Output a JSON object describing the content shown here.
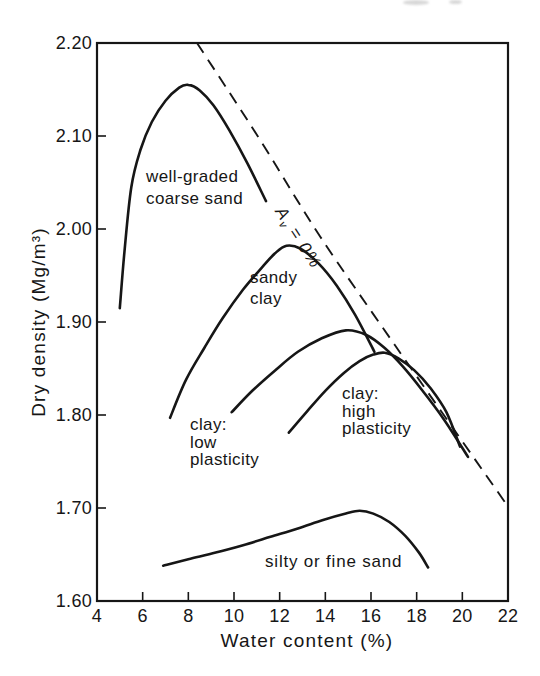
{
  "figure": {
    "y_axis": {
      "title": "Dry density (Mg/m³)",
      "tick_labels": [
        "2.20",
        "2.10",
        "2.00",
        "1.90",
        "1.80",
        "1.70",
        "1.60"
      ],
      "tick_values": [
        2.2,
        2.1,
        2.0,
        1.9,
        1.8,
        1.7,
        1.6
      ]
    },
    "x_axis": {
      "title": "Water content (%)",
      "tick_labels": [
        "4",
        "6",
        "8",
        "10",
        "12",
        "14",
        "16",
        "18",
        "20",
        "22"
      ],
      "tick_values": [
        4,
        6,
        8,
        10,
        12,
        14,
        16,
        18,
        20,
        22
      ]
    },
    "curve_labels": {
      "coarse_sand": "well-graded\ncoarse sand",
      "sandy_clay": "sandy\nclay",
      "clay_low": "clay:\nlow\nplasticity",
      "clay_high": "clay:\nhigh\nplasticity",
      "silty_sand": "silty or fine sand"
    },
    "av_label": {
      "base": "A",
      "sub": "v",
      "rest": " = 0%"
    }
  },
  "chart_data": {
    "type": "line",
    "xlabel": "Water content (%)",
    "ylabel": "Dry density (Mg/m³)",
    "xlim": [
      4,
      22
    ],
    "ylim": [
      1.6,
      2.2
    ],
    "grid": false,
    "legend_position": "inline-labels",
    "series": [
      {
        "name": "well-graded coarse sand",
        "style": "solid",
        "peak": [
          8.0,
          2.155
        ],
        "points": [
          [
            5.0,
            1.915
          ],
          [
            5.2,
            1.975
          ],
          [
            5.5,
            2.045
          ],
          [
            5.9,
            2.085
          ],
          [
            6.4,
            2.115
          ],
          [
            7.0,
            2.138
          ],
          [
            7.6,
            2.152
          ],
          [
            8.0,
            2.155
          ],
          [
            8.5,
            2.149
          ],
          [
            9.1,
            2.133
          ],
          [
            9.8,
            2.106
          ],
          [
            10.6,
            2.07
          ],
          [
            11.4,
            2.03
          ]
        ]
      },
      {
        "name": "sandy clay",
        "style": "solid",
        "peak": [
          12.3,
          1.982
        ],
        "points": [
          [
            7.2,
            1.797
          ],
          [
            7.9,
            1.838
          ],
          [
            8.7,
            1.872
          ],
          [
            9.5,
            1.904
          ],
          [
            10.4,
            1.935
          ],
          [
            11.2,
            1.958
          ],
          [
            11.8,
            1.974
          ],
          [
            12.3,
            1.982
          ],
          [
            12.9,
            1.979
          ],
          [
            13.7,
            1.963
          ],
          [
            14.5,
            1.939
          ],
          [
            15.3,
            1.908
          ],
          [
            16.15,
            1.868
          ]
        ]
      },
      {
        "name": "clay: low plasticity",
        "style": "solid",
        "peak": [
          14.9,
          1.891
        ],
        "points": [
          [
            9.9,
            1.803
          ],
          [
            10.8,
            1.826
          ],
          [
            11.8,
            1.848
          ],
          [
            12.8,
            1.868
          ],
          [
            13.8,
            1.882
          ],
          [
            14.9,
            1.891
          ],
          [
            15.8,
            1.886
          ],
          [
            16.6,
            1.872
          ],
          [
            17.4,
            1.852
          ],
          [
            18.2,
            1.828
          ],
          [
            19.2,
            1.795
          ],
          [
            20.25,
            1.755
          ]
        ]
      },
      {
        "name": "clay: high plasticity",
        "style": "solid",
        "peak": [
          16.6,
          1.867
        ],
        "points": [
          [
            12.4,
            1.781
          ],
          [
            13.2,
            1.804
          ],
          [
            14.0,
            1.826
          ],
          [
            14.8,
            1.845
          ],
          [
            15.5,
            1.858
          ],
          [
            16.1,
            1.865
          ],
          [
            16.6,
            1.867
          ],
          [
            17.2,
            1.861
          ],
          [
            17.9,
            1.848
          ],
          [
            18.6,
            1.829
          ],
          [
            19.3,
            1.803
          ],
          [
            19.9,
            1.766
          ]
        ]
      },
      {
        "name": "silty or fine sand",
        "style": "solid",
        "peak": [
          15.5,
          1.697
        ],
        "points": [
          [
            6.9,
            1.638
          ],
          [
            8.0,
            1.645
          ],
          [
            9.2,
            1.652
          ],
          [
            10.4,
            1.66
          ],
          [
            11.6,
            1.669
          ],
          [
            12.8,
            1.678
          ],
          [
            13.9,
            1.687
          ],
          [
            14.9,
            1.694
          ],
          [
            15.5,
            1.697
          ],
          [
            16.1,
            1.694
          ],
          [
            16.8,
            1.685
          ],
          [
            17.5,
            1.67
          ],
          [
            18.1,
            1.652
          ],
          [
            18.5,
            1.636
          ]
        ]
      }
    ],
    "reference_line": {
      "name": "zero air voids line (Av = 0%)",
      "style": "dashed",
      "points": [
        [
          8.38,
          2.2
        ],
        [
          11.14,
          2.096
        ],
        [
          13.77,
          1.992
        ],
        [
          17.05,
          1.875
        ],
        [
          20.42,
          1.757
        ],
        [
          21.96,
          1.703
        ]
      ]
    }
  },
  "ink_color": "#161616",
  "background_color": "#ffffff"
}
